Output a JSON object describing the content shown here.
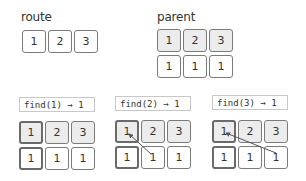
{
  "route": {
    "title": "route",
    "values": [
      "1",
      "2",
      "3"
    ]
  },
  "parent": {
    "title": "parent",
    "keys": [
      "1",
      "2",
      "3"
    ],
    "values": [
      "1",
      "1",
      "1"
    ]
  },
  "panels": [
    {
      "call": "find(1) → 1",
      "keys": [
        "1",
        "2",
        "3"
      ],
      "values": [
        "1",
        "1",
        "1"
      ],
      "highlight_index": 0,
      "arrow_from_index": null
    },
    {
      "call": "find(2) → 1",
      "keys": [
        "1",
        "2",
        "3"
      ],
      "values": [
        "1",
        "1",
        "1"
      ],
      "highlight_index": 0,
      "arrow_from_index": 1
    },
    {
      "call": "find(3) → 1",
      "keys": [
        "1",
        "2",
        "3"
      ],
      "values": [
        "1",
        "1",
        "1"
      ],
      "highlight_index": 0,
      "arrow_from_index": 2
    }
  ],
  "colors": {
    "cell_border": "#7a7a7a",
    "key_fill": "#ececec",
    "value_fill": "#ffffff",
    "arrow": "#555555"
  }
}
